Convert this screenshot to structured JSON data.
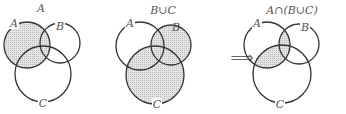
{
  "diagrams": [
    {
      "title": "A",
      "shaded": "A"
    },
    {
      "title": "B∪C",
      "shaded": "B union C"
    },
    {
      "title": "A∩(B∪C)",
      "shaded": "A intersect (B union C)"
    }
  ],
  "labels": {
    "a": "A",
    "b": "B",
    "c": "C"
  },
  "arrow": "⟹",
  "colors": {
    "shade": "#d6d6d6",
    "stroke": "#333333",
    "text": "#555555"
  }
}
